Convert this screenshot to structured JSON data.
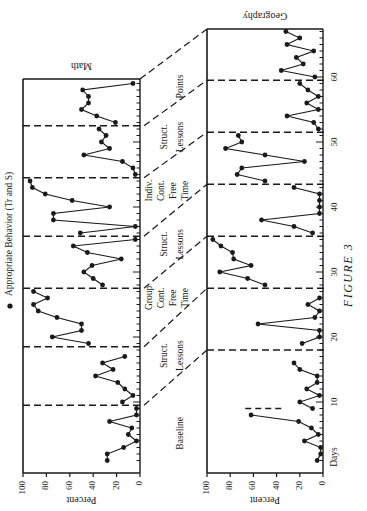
{
  "figure": {
    "caption": "FIGURE 3",
    "legend_label": "Appropriate Behavior (Tr and S)",
    "legend_marker": "filled-circle",
    "orientation": "rotated-90-ccw",
    "ink_color": "#1a1a1a",
    "background": "#ffffff"
  },
  "chart_data": [
    {
      "type": "line",
      "title": "Math",
      "xlabel": "Days",
      "ylabel": "Percent",
      "ylim": [
        0,
        100
      ],
      "yticks": [
        0,
        20,
        40,
        60,
        80,
        100
      ],
      "xlim": [
        0,
        66
      ],
      "xticks": [
        10,
        20,
        30,
        40,
        50,
        60
      ],
      "grid": false,
      "phases": [
        {
          "label": "Baseline",
          "start": 1,
          "end": 9
        },
        {
          "label": "Struct. Lessons",
          "start": 10,
          "end": 18
        },
        {
          "label": "Group Cont. Free Time",
          "start": 19,
          "end": 27
        },
        {
          "label": "Struct. Lessons",
          "start": 28,
          "end": 35
        },
        {
          "label": "Indiv. Cont. Free Time",
          "start": 36,
          "end": 44
        },
        {
          "label": "Struct. Lessons",
          "start": 45,
          "end": 52
        },
        {
          "label": "Points",
          "start": 53,
          "end": 59
        }
      ],
      "phase_lines": [
        9.5,
        18.5,
        27.5,
        35.5,
        44.5,
        52.5
      ],
      "series": [
        {
          "name": "Appropriate Behavior (Tr and S)",
          "segments": [
            {
              "x": [
                1,
                2,
                3,
                4,
                5,
                6,
                7,
                8,
                9
              ],
              "y": [
                28,
                28,
                14,
                3,
                10,
                7,
                26,
                3,
                3
              ]
            },
            {
              "x": [
                10,
                11,
                12,
                13,
                14,
                15,
                16,
                17
              ],
              "y": [
                15,
                6,
                13,
                19,
                38,
                23,
                32,
                13
              ]
            },
            {
              "x": [
                19,
                20,
                21,
                22,
                23,
                24,
                25,
                26,
                27
              ],
              "y": [
                44,
                75,
                50,
                50,
                71,
                87,
                91,
                79,
                91
              ]
            },
            {
              "x": [
                28,
                29,
                30,
                31,
                32,
                33,
                34,
                35
              ],
              "y": [
                32,
                40,
                48,
                41,
                16,
                45,
                57,
                4
              ]
            },
            {
              "x": [
                36,
                37,
                38,
                39,
                40,
                41,
                42,
                43,
                44
              ],
              "y": [
                51,
                4,
                74,
                74,
                26,
                58,
                81,
                92,
                94
              ]
            },
            {
              "x": [
                45,
                46,
                47,
                48,
                49,
                50,
                51,
                52
              ],
              "y": [
                4,
                6,
                15,
                48,
                26,
                33,
                29,
                35
              ]
            },
            {
              "x": [
                53,
                54,
                55,
                56,
                57,
                58,
                59
              ],
              "y": [
                21,
                37,
                50,
                44,
                44,
                49,
                6
              ]
            }
          ]
        }
      ]
    },
    {
      "type": "line",
      "title": "Geography",
      "xlabel": "Days",
      "ylabel": "Percent",
      "ylim": [
        0,
        100
      ],
      "yticks": [
        0,
        20,
        40,
        60,
        80,
        100
      ],
      "xlim": [
        0,
        67
      ],
      "xticks": [
        10,
        20,
        30,
        40,
        50,
        60
      ],
      "grid": false,
      "phases": [
        {
          "label": "Baseline",
          "start": 1,
          "end": 17
        },
        {
          "label": "Struct. Lessons",
          "start": 18,
          "end": 26
        },
        {
          "label": "Free Time",
          "start": 27,
          "end": 35
        },
        {
          "label": "Struct. Lessons",
          "start": 36,
          "end": 43
        },
        {
          "label": "Free Time",
          "start": 44,
          "end": 51
        },
        {
          "label": "Struct. Lessons",
          "start": 52,
          "end": 59
        },
        {
          "label": "Points",
          "start": 60,
          "end": 66
        }
      ],
      "phase_lines": [
        18,
        27.5,
        35.5,
        43.5,
        51.5,
        59.5
      ],
      "annotation_short_line_at_day": 9,
      "series": [
        {
          "name": "Appropriate Behavior (Tr and S)",
          "segments": [
            {
              "x": [
                1,
                2,
                3,
                4,
                5,
                6,
                7,
                8
              ],
              "y": [
                5,
                2,
                2,
                16,
                4,
                10,
                21,
                62,
                3
              ]
            },
            {
              "x": [
                9,
                10,
                11,
                12,
                13,
                14,
                15,
                16
              ],
              "y": [
                9,
                20,
                3,
                14,
                5,
                5,
                20,
                25
              ]
            },
            {
              "x": [
                19,
                20,
                21,
                22,
                23,
                24,
                25,
                26
              ],
              "y": [
                18,
                3,
                3,
                56,
                7,
                3,
                13,
                3
              ]
            },
            {
              "x": [
                28,
                29,
                30,
                31,
                32,
                33,
                34,
                35
              ],
              "y": [
                50,
                65,
                89,
                62,
                77,
                78,
                88,
                95
              ]
            },
            {
              "x": [
                36,
                37,
                38,
                39,
                40,
                41,
                42,
                43
              ],
              "y": [
                9,
                25,
                53,
                3,
                3,
                3,
                3,
                25
              ]
            },
            {
              "x": [
                44,
                45,
                46,
                47,
                48,
                49,
                50,
                51
              ],
              "y": [
                50,
                74,
                70,
                16,
                50,
                84,
                70,
                73
              ]
            },
            {
              "x": [
                52,
                53,
                54,
                55,
                56,
                57,
                58,
                59
              ],
              "y": [
                4,
                8,
                31,
                4,
                14,
                4,
                13,
                20
              ]
            },
            {
              "x": [
                60,
                61,
                62,
                63,
                64,
                65,
                66,
                67
              ],
              "y": [
                7,
                36,
                17,
                23,
                8,
                31,
                20,
                32
              ]
            }
          ]
        }
      ]
    }
  ]
}
